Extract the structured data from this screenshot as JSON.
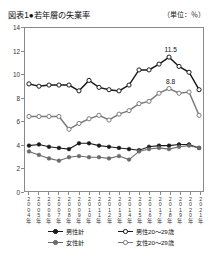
{
  "header": {
    "title": "図表1●若年層の失業率",
    "unit": "（単位：％）"
  },
  "chart_data": {
    "type": "line",
    "title": "図表1●若年層の失業率",
    "xlabel": "",
    "ylabel": "",
    "unit": "％",
    "ylim": [
      0,
      14
    ],
    "ytick_step": 2,
    "yticks": [
      "0",
      "2",
      "4",
      "6",
      "8",
      "10",
      "12",
      "14"
    ],
    "grid": false,
    "legend_position": "bottom",
    "categories": [
      "2004年",
      "2005年",
      "2006年",
      "2007年",
      "2008年",
      "2009年",
      "2010年",
      "2011年",
      "2012年",
      "2013年",
      "2014年",
      "2015年",
      "2016年",
      "2017年",
      "2018年",
      "2019年",
      "2020年",
      "2021年"
    ],
    "series": [
      {
        "name": "男性計",
        "marker": "filled-circle",
        "color": "#1a1a1a",
        "values": [
          3.9,
          4.0,
          3.8,
          3.7,
          3.6,
          4.1,
          4.1,
          3.9,
          3.8,
          3.7,
          3.6,
          3.5,
          3.8,
          3.9,
          3.9,
          4.0,
          4.0,
          3.7
        ]
      },
      {
        "name": "女性計",
        "marker": "filled-circle",
        "color": "#6b6b6b",
        "values": [
          3.4,
          3.1,
          2.8,
          2.6,
          2.9,
          3.0,
          2.9,
          2.9,
          2.8,
          3.0,
          2.7,
          3.4,
          3.6,
          3.7,
          3.6,
          3.8,
          3.9,
          3.7
        ]
      },
      {
        "name": "男性20～29歳",
        "marker": "open-circle",
        "color": "#1a1a1a",
        "values": [
          9.2,
          9.0,
          9.1,
          9.1,
          9.1,
          8.6,
          9.5,
          8.9,
          8.7,
          8.6,
          9.1,
          10.4,
          10.4,
          10.9,
          11.5,
          10.7,
          10.2,
          8.7
        ]
      },
      {
        "name": "女性20～29歳",
        "marker": "open-circle",
        "color": "#7a7a7a",
        "values": [
          6.4,
          6.4,
          6.4,
          6.4,
          5.3,
          5.8,
          6.2,
          6.5,
          6.1,
          6.6,
          6.9,
          7.5,
          7.7,
          8.4,
          8.8,
          8.4,
          8.5,
          6.5
        ]
      }
    ],
    "annotations": [
      {
        "label": "11.5",
        "series": "男性20～29歳",
        "category": "2018年",
        "value": 11.5
      },
      {
        "label": "8.8",
        "series": "女性20～29歳",
        "category": "2018年",
        "value": 8.8
      }
    ]
  },
  "legend": {
    "items": [
      {
        "label": "男性計",
        "marker": "filled-circle",
        "color": "#1a1a1a"
      },
      {
        "label": "女性計",
        "marker": "filled-circle",
        "color": "#6b6b6b"
      },
      {
        "label": "男性20～29歳",
        "marker": "open-circle",
        "color": "#1a1a1a"
      },
      {
        "label": "女性20～29歳",
        "marker": "open-circle",
        "color": "#7a7a7a"
      }
    ]
  }
}
